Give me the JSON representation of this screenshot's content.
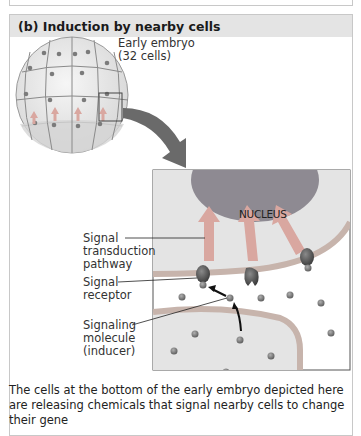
{
  "panel": {
    "title": "(b) Induction by nearby cells"
  },
  "embryo": {
    "label_line1": "Early embryo",
    "label_line2": "(32 cells)"
  },
  "inset": {
    "nucleus_label": "NUCLEUS"
  },
  "labels": {
    "signal_transduction": [
      "Signal",
      "transduction",
      "pathway"
    ],
    "signal_receptor": [
      "Signal",
      "receptor"
    ],
    "signaling_molecule": [
      "Signaling",
      "molecule",
      "(inducer)"
    ]
  },
  "caption": "The cells at the bottom of the early embryo depicted here are releasing chemicals that signal nearby cells to change their gene",
  "colors": {
    "header_bg": "#e4e4e4",
    "embryo_fill": "#ececec",
    "nucleus": "#8e8a92",
    "cell_bg": "#e6e6e6",
    "membrane": "#b8a8a0",
    "arrow_pink": "#d9a7a0",
    "big_arrow": "#6e6e6e",
    "molecule": "#7a7a7a"
  }
}
